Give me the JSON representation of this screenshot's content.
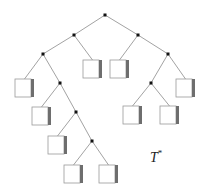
{
  "diagram": {
    "label": "T",
    "label_superscript": "*",
    "colors": {
      "edge": "#8a8a8a",
      "node": "#111111",
      "leaf_border": "#9a9a9a",
      "leaf_shadow": "#6e6e6e"
    },
    "internal_nodes": [
      {
        "id": "root",
        "x": 105,
        "y": 15
      },
      {
        "id": "L",
        "x": 43,
        "y": 54,
        "parent": "a"
      },
      {
        "id": "a",
        "x": 74,
        "y": 35,
        "parent": "root"
      },
      {
        "id": "b",
        "x": 138,
        "y": 35,
        "parent": "root"
      },
      {
        "id": "LR",
        "x": 60,
        "y": 83,
        "parent": "L"
      },
      {
        "id": "LRR",
        "x": 76,
        "y": 112,
        "parent": "LR"
      },
      {
        "id": "LRRR",
        "x": 92,
        "y": 141,
        "parent": "LRR"
      },
      {
        "id": "bR",
        "x": 168,
        "y": 54,
        "parent": "b"
      },
      {
        "id": "bRL",
        "x": 151,
        "y": 83,
        "parent": "bR"
      }
    ],
    "leaves": [
      {
        "x": 15,
        "y": 79,
        "parent": "L"
      },
      {
        "x": 83,
        "y": 60,
        "parent": "a"
      },
      {
        "x": 110,
        "y": 60,
        "parent": "b"
      },
      {
        "x": 32,
        "y": 107,
        "parent": "LR"
      },
      {
        "x": 48,
        "y": 136,
        "parent": "LRR"
      },
      {
        "x": 64,
        "y": 165,
        "parent": "LRRR"
      },
      {
        "x": 99,
        "y": 165,
        "parent": "LRRR"
      },
      {
        "x": 176,
        "y": 79,
        "parent": "bR"
      },
      {
        "x": 123,
        "y": 106,
        "parent": "bRL"
      },
      {
        "x": 160,
        "y": 106,
        "parent": "bRL"
      }
    ]
  }
}
